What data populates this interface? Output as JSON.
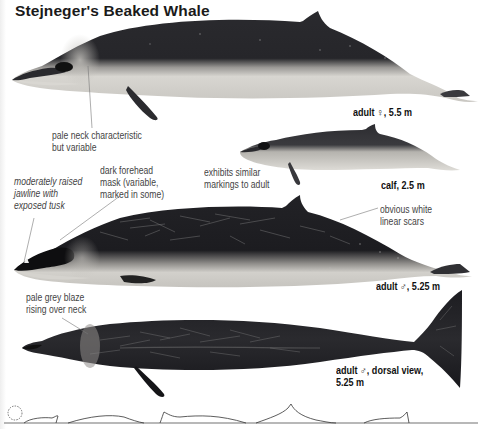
{
  "title": "Stejneger's Beaked Whale",
  "colors": {
    "background": "#ffffff",
    "body_dark": "#1e1e22",
    "belly_pale": "#d9d7d2",
    "scar_lines": "#9a9a9a",
    "annotation_text": "#444444",
    "caption_text": "#111111",
    "leader_line": "#777777"
  },
  "figures": [
    {
      "id": "adult-female",
      "caption": "adult ♀, 5.5 m"
    },
    {
      "id": "calf",
      "caption": "calf, 2.5 m"
    },
    {
      "id": "adult-male",
      "caption": "adult ♂, 5.25 m"
    },
    {
      "id": "adult-male-dorsal",
      "caption_line1": "adult ♂, dorsal view,",
      "caption_line2": "5.25 m"
    }
  ],
  "annotations": {
    "pale_neck": [
      "pale neck characteristic",
      "but variable"
    ],
    "calf_markings": [
      "exhibits similar",
      "markings to adult"
    ],
    "jawline": [
      "moderately raised",
      "jawline with",
      "exposed tusk"
    ],
    "forehead_mask": [
      "dark forehead",
      "mask (variable,",
      "marked in some)"
    ],
    "scars": [
      "obvious white",
      "linear scars"
    ],
    "grey_blaze": [
      "pale grey blaze",
      "rising over neck"
    ]
  },
  "surfacing_sequence": {
    "label": "dive sequence silhouettes",
    "icons": [
      "blow-icon",
      "head-surfacing",
      "back-rolling",
      "dorsal-fin-high",
      "tail-stock-arch"
    ]
  }
}
